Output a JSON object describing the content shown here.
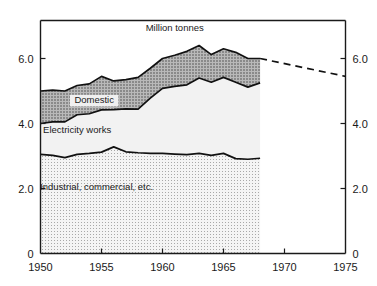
{
  "chart_data": {
    "type": "area",
    "title": "",
    "unit_label": "Million tonnes",
    "xlabel": "",
    "ylabel": "",
    "xlim": [
      1950,
      1975
    ],
    "ylim": [
      0,
      7.0
    ],
    "grid": false,
    "legend_position": "inline-on-bands",
    "x_ticks": [
      "1950",
      "1955",
      "1960",
      "1965",
      "1970",
      "1975"
    ],
    "x_tick_values": [
      1950,
      1955,
      1960,
      1965,
      1970,
      1975
    ],
    "y_ticks_left": [
      "0",
      "2.0",
      "4.0",
      "6.0"
    ],
    "y_ticks_right": [
      "0",
      "2.0",
      "4.0",
      "6.0"
    ],
    "y_tick_values": [
      0,
      2.0,
      4.0,
      6.0
    ],
    "x": [
      1950,
      1951,
      1952,
      1953,
      1954,
      1955,
      1956,
      1957,
      1958,
      1959,
      1960,
      1961,
      1962,
      1963,
      1964,
      1965,
      1966,
      1967,
      1968
    ],
    "series": [
      {
        "name": "Industrial, commercial, etc.",
        "label": "Industrial, commercial, etc.",
        "stack_order": 1,
        "fill": "#ececec",
        "pattern": "fine-dots",
        "values": [
          3.05,
          3.02,
          2.95,
          3.05,
          3.08,
          3.12,
          3.28,
          3.13,
          3.1,
          3.08,
          3.08,
          3.06,
          3.04,
          3.08,
          3.02,
          3.08,
          2.92,
          2.9,
          2.93
        ]
      },
      {
        "name": "Electricity works",
        "label": "Electricity works",
        "stack_order": 2,
        "fill": "#f2f2f2",
        "pattern": "solid-light",
        "values": [
          0.95,
          1.03,
          1.1,
          1.22,
          1.22,
          1.3,
          1.15,
          1.32,
          1.34,
          1.7,
          2.0,
          2.08,
          2.15,
          2.32,
          2.25,
          2.34,
          2.35,
          2.22,
          2.32
        ]
      },
      {
        "name": "Domestic",
        "label": "Domestic",
        "stack_order": 3,
        "fill": "#9a9a9a",
        "pattern": "cross-hatch",
        "values": [
          1.0,
          0.98,
          0.95,
          0.9,
          0.92,
          1.03,
          0.88,
          0.9,
          0.98,
          0.92,
          0.92,
          0.96,
          1.03,
          1.0,
          0.85,
          0.88,
          0.92,
          0.88,
          0.75
        ]
      }
    ],
    "stack_totals": [
      5.0,
      5.03,
      5.0,
      5.17,
      5.22,
      5.45,
      5.31,
      5.35,
      5.42,
      5.7,
      6.0,
      6.1,
      6.22,
      6.4,
      6.12,
      6.3,
      6.19,
      6.0,
      6.0
    ],
    "band_boundaries": {
      "industrial_top": [
        3.05,
        3.02,
        2.95,
        3.05,
        3.08,
        3.12,
        3.28,
        3.13,
        3.1,
        3.08,
        3.08,
        3.06,
        3.04,
        3.08,
        3.02,
        3.08,
        2.92,
        2.9,
        2.93
      ],
      "electricity_top": [
        4.0,
        4.05,
        4.05,
        4.27,
        4.3,
        4.42,
        4.43,
        4.45,
        4.44,
        4.78,
        5.08,
        5.14,
        5.19,
        5.4,
        5.27,
        5.42,
        5.27,
        5.12,
        5.25
      ],
      "domestic_top": [
        5.0,
        5.03,
        5.0,
        5.17,
        5.22,
        5.45,
        5.31,
        5.35,
        5.42,
        5.7,
        6.0,
        6.1,
        6.22,
        6.4,
        6.12,
        6.3,
        6.19,
        6.0,
        6.0
      ]
    },
    "projection": {
      "name": "projected total",
      "style": "dashed",
      "x": [
        1968,
        1975
      ],
      "values": [
        6.0,
        5.45
      ]
    },
    "annotations": [
      {
        "text": "Million tonnes",
        "x": 1961.0,
        "y": 6.85,
        "name": "unit-annotation"
      },
      {
        "text": "Domestic",
        "x": 1954.4,
        "y": 4.62,
        "name": "domestic-annotation"
      },
      {
        "text": "Electricity works",
        "x": 1953.0,
        "y": 3.72,
        "name": "electricity-annotation"
      },
      {
        "text": "Industrial, commercial, etc.",
        "x": 1954.6,
        "y": 1.95,
        "name": "industrial-annotation"
      }
    ],
    "colors": {
      "axis": "#1a1a1a",
      "domestic": "#9a9a9a",
      "electricity": "#f2f2f2",
      "industrial": "#ececec",
      "curve_stroke": "#111111",
      "projection_stroke": "#111111"
    }
  }
}
